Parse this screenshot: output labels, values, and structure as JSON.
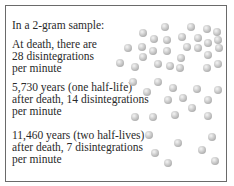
{
  "panel": {
    "heading": "In a 2-gram sample:",
    "stages": [
      {
        "lines": [
          "At death, there are",
          "28 disintegrations",
          "per minute"
        ],
        "count": 28
      },
      {
        "lines": [
          "5,730 years (one half-life)",
          "after death, 14 disintegrations",
          "per minute"
        ],
        "count": 14
      },
      {
        "lines": [
          "11,460 years (two half-lives)",
          "after death, 7 disintegrations",
          "per minute"
        ],
        "count": 7
      }
    ]
  },
  "dots": {
    "stage0": [
      [
        165,
        27
      ],
      [
        143,
        33
      ],
      [
        154,
        39
      ],
      [
        167,
        40
      ],
      [
        128,
        48
      ],
      [
        142,
        47
      ],
      [
        153,
        51
      ],
      [
        167,
        51
      ],
      [
        143,
        57
      ],
      [
        120,
        63
      ],
      [
        135,
        67
      ],
      [
        158,
        64
      ],
      [
        170,
        66
      ],
      [
        191,
        27
      ],
      [
        207,
        29
      ],
      [
        217,
        32
      ],
      [
        182,
        37
      ],
      [
        198,
        38
      ],
      [
        208,
        43
      ],
      [
        218,
        40
      ],
      [
        187,
        47
      ],
      [
        198,
        48
      ],
      [
        208,
        55
      ],
      [
        219,
        48
      ],
      [
        181,
        58
      ],
      [
        180,
        68
      ],
      [
        207,
        68
      ],
      [
        218,
        64
      ]
    ],
    "stage1": [
      [
        133,
        82
      ],
      [
        158,
        82
      ],
      [
        147,
        92
      ],
      [
        173,
        88
      ],
      [
        197,
        89
      ],
      [
        218,
        90
      ],
      [
        168,
        100
      ],
      [
        183,
        98
      ],
      [
        208,
        100
      ],
      [
        192,
        108
      ],
      [
        135,
        117
      ],
      [
        153,
        117
      ],
      [
        175,
        115
      ],
      [
        208,
        116
      ]
    ],
    "stage2": [
      [
        149,
        135
      ],
      [
        178,
        143
      ],
      [
        212,
        137
      ],
      [
        155,
        153
      ],
      [
        202,
        150
      ],
      [
        168,
        163
      ],
      [
        215,
        161
      ]
    ]
  }
}
